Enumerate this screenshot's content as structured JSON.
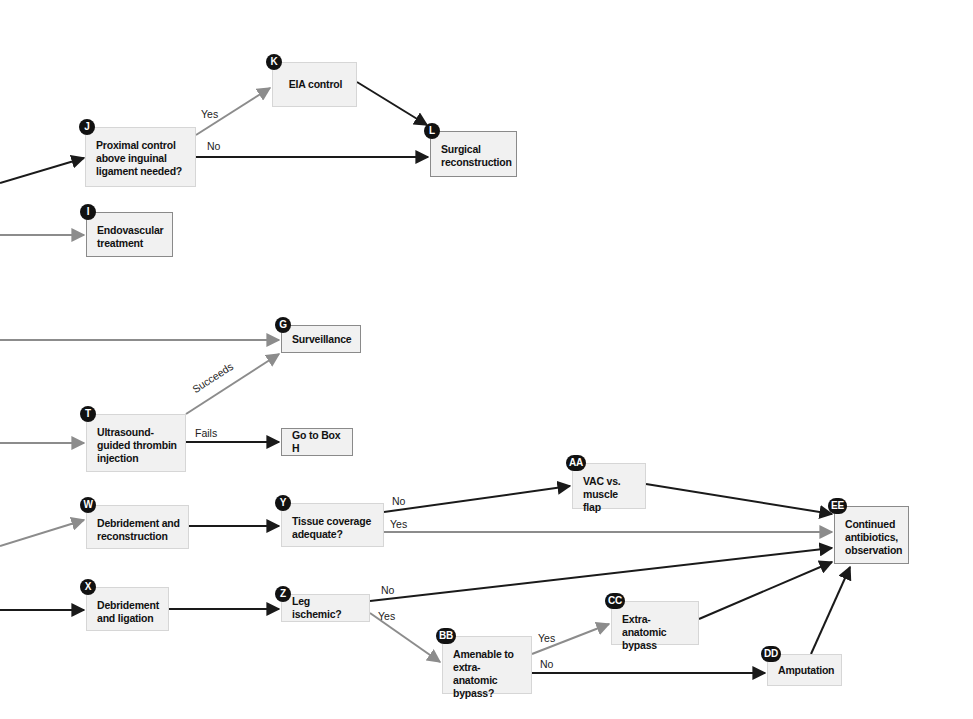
{
  "colors": {
    "black_edge": "#1a1a1a",
    "gray_edge": "#8c8c8c",
    "box_fill": "#f1f1f1",
    "badge": "#111111"
  },
  "nodes": {
    "J": {
      "badge": "J",
      "text": "Proximal control\nabove inguinal\nligament needed?"
    },
    "K": {
      "badge": "K",
      "text": "EIA control"
    },
    "L": {
      "badge": "L",
      "text": "Surgical\nreconstruction"
    },
    "I": {
      "badge": "I",
      "text": "Endovascular\ntreatment"
    },
    "G": {
      "badge": "G",
      "text": "Surveillance"
    },
    "T": {
      "badge": "T",
      "text": "Ultrasound-\nguided thrombin\ninjection"
    },
    "H": {
      "text": "Go to Box H"
    },
    "W": {
      "badge": "W",
      "text": "Debridement and\nreconstruction"
    },
    "Y": {
      "badge": "Y",
      "text": "Tissue coverage\nadequate?"
    },
    "AA": {
      "badge": "AA",
      "text": "VAC vs.\nmuscle flap"
    },
    "EE": {
      "badge": "EE",
      "text": "Continued\nantibiotics,\nobservation"
    },
    "X": {
      "badge": "X",
      "text": "Debridement\nand ligation"
    },
    "Z": {
      "badge": "Z",
      "text": "Leg ischemic?"
    },
    "BB": {
      "badge": "BB",
      "text": "Amenable to\nextra-anatomic\nbypass?"
    },
    "CC": {
      "badge": "CC",
      "text": "Extra-anatomic\nbypass"
    },
    "DD": {
      "badge": "DD",
      "text": "Amputation"
    }
  },
  "edge_labels": {
    "j_yes": "Yes",
    "j_no": "No",
    "t_succeeds": "Succeeds",
    "t_fails": "Fails",
    "y_no": "No",
    "y_yes": "Yes",
    "z_no": "No",
    "z_yes": "Yes",
    "bb_yes": "Yes",
    "bb_no": "No"
  }
}
